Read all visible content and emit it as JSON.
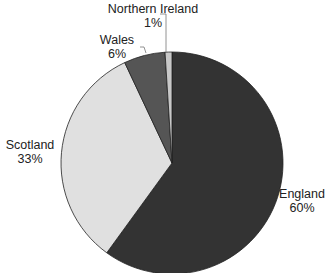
{
  "chart_data": {
    "type": "pie",
    "title": "",
    "categories": [
      "England",
      "Scotland",
      "Wales",
      "Northern Ireland"
    ],
    "values": [
      60,
      33,
      6,
      1
    ],
    "unit": "%",
    "labels": [
      {
        "name": "England",
        "pct": "60%"
      },
      {
        "name": "Scotland",
        "pct": "33%"
      },
      {
        "name": "Wales",
        "pct": "6%"
      },
      {
        "name": "Northern Ireland",
        "pct": "1%"
      }
    ],
    "colors": [
      "#333333",
      "#e0e0e0",
      "#555555",
      "#c8c8c8"
    ],
    "start_angle_deg": 0,
    "direction": "clockwise",
    "legend": "none (data labels on slices)"
  }
}
